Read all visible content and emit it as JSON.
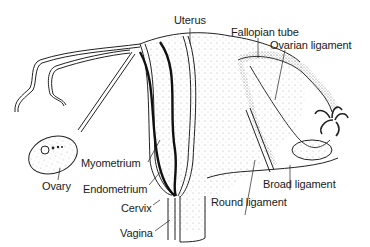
{
  "diagram": {
    "labels": {
      "uterus": "Uterus",
      "fallopian_tube": "Fallopian tube",
      "ovarian_ligament": "Ovarian ligament",
      "ovary": "Ovary",
      "myometrium": "Myometrium",
      "endometrium": "Endometrium",
      "cervix": "Cervix",
      "vagina": "Vagina",
      "round_ligament": "Round ligament",
      "broad_ligament": "Broad ligament"
    },
    "colors": {
      "ink": "#1a1a1a",
      "stipple": "#9a9a9a",
      "background": "#ffffff"
    }
  }
}
